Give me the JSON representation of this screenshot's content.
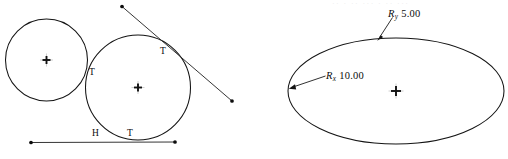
{
  "figure": {
    "background_color": "#ffffff",
    "ink_color": "#141414",
    "width": 508,
    "height": 159
  },
  "left_diagram": {
    "name": "tangent-circles-diagram",
    "small_circle": {
      "label": "small-circle",
      "cx": 46.5,
      "cy": 60.0,
      "r": 41.0
    },
    "large_circle": {
      "label": "large-circle",
      "cx": 138.0,
      "cy": 87.5,
      "r": 52.5
    },
    "horizontal_line": {
      "label": "horizontal-tangent-line",
      "x1": 31.0,
      "y1": 142.5,
      "x2": 175.0,
      "y2": 142.0
    },
    "diagonal_line": {
      "label": "diagonal-tangent-line",
      "x1": 122.0,
      "y1": 6.5,
      "x2": 232.0,
      "y2": 101.0
    },
    "constraint_labels": [
      {
        "text": "T",
        "meaning": "tangent-constraint",
        "x": 89.0,
        "y": 68.0
      },
      {
        "text": "T",
        "meaning": "tangent-constraint",
        "x": 160.0,
        "y": 47.0
      },
      {
        "text": "T",
        "meaning": "tangent-constraint",
        "x": 127.0,
        "y": 129.0
      },
      {
        "text": "H",
        "meaning": "horizontal-constraint",
        "x": 92.0,
        "y": 129.0
      }
    ]
  },
  "right_diagram": {
    "name": "ellipse-dimension-diagram",
    "ellipse": {
      "label": "ellipse",
      "cx": 396.0,
      "cy": 91.0,
      "rx": 108.0,
      "ry": 53.0
    },
    "dimensions": [
      {
        "name": "ellipse-minor-radius-dimension",
        "symbol": "R",
        "subscript": "y",
        "value": "5.00",
        "full_text": "Ry 5.00",
        "label_x": 388.0,
        "label_y": 9.0,
        "leader_from_x": 390.0,
        "leader_from_y": 19.0,
        "leader_to_x": 378.0,
        "leader_to_y": 38.5,
        "arrow_target": "ellipse-top-vertex"
      },
      {
        "name": "ellipse-major-radius-dimension",
        "symbol": "R",
        "subscript": "x",
        "value": "10.00",
        "full_text": "Rx 10.00",
        "label_x": 326.0,
        "label_y": 71.0,
        "leader_from_x": 324.0,
        "leader_from_y": 77.0,
        "leader_to_x": 290.5,
        "leader_to_y": 88.0,
        "arrow_target": "ellipse-left-vertex"
      }
    ],
    "faint_header_text": "·· · ·· ··· ·  ·· ···"
  }
}
